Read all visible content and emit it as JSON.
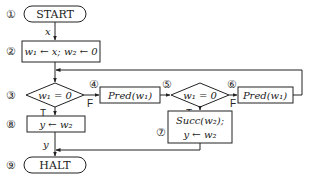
{
  "diagram": {
    "type": "flowchart",
    "nodes": [
      {
        "id": "1",
        "number": "①",
        "shape": "terminal",
        "label": "START"
      },
      {
        "id": "2",
        "number": "②",
        "shape": "process",
        "label": "w₁ ← x; w₂ ← 0"
      },
      {
        "id": "3",
        "number": "③",
        "shape": "decision",
        "label": "w₁ = 0"
      },
      {
        "id": "4",
        "number": "④",
        "shape": "process",
        "label": "Pred(w₁)"
      },
      {
        "id": "5",
        "number": "⑤",
        "shape": "decision",
        "label": "w₁ = 0"
      },
      {
        "id": "6",
        "number": "⑥",
        "shape": "process",
        "label": "Pred(w₁)"
      },
      {
        "id": "7",
        "number": "⑦",
        "shape": "process",
        "label_line1": "Succ(w₂);",
        "label_line2": "y ← w₂"
      },
      {
        "id": "8",
        "number": "⑧",
        "shape": "process",
        "label": "y ← w₂"
      },
      {
        "id": "9",
        "number": "⑨",
        "shape": "terminal",
        "label": "HALT"
      }
    ],
    "edge_labels": {
      "input": "x",
      "output": "y",
      "d3_true": "T",
      "d3_false": "F",
      "d5_true": "T",
      "d5_false": "F"
    },
    "edges": [
      {
        "from": "1",
        "to": "2",
        "label": "x"
      },
      {
        "from": "2",
        "to": "3"
      },
      {
        "from": "3",
        "to": "8",
        "label": "T"
      },
      {
        "from": "3",
        "to": "4",
        "label": "F"
      },
      {
        "from": "4",
        "to": "5"
      },
      {
        "from": "5",
        "to": "7",
        "label": "T"
      },
      {
        "from": "5",
        "to": "6",
        "label": "F"
      },
      {
        "from": "6",
        "to": "3"
      },
      {
        "from": "7",
        "to": "9"
      },
      {
        "from": "8",
        "to": "9",
        "label": "y"
      }
    ]
  }
}
